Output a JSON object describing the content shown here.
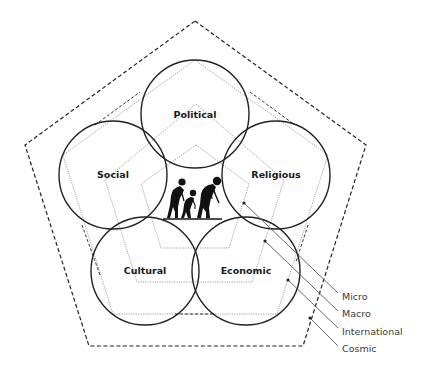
{
  "diagram": {
    "domains": [
      {
        "label": "Political",
        "cx": 195,
        "cy": 114,
        "r": 54
      },
      {
        "label": "Social",
        "cx": 113,
        "cy": 175,
        "r": 54
      },
      {
        "label": "Religious",
        "cx": 276,
        "cy": 175,
        "r": 54
      },
      {
        "label": "Cultural",
        "cx": 145,
        "cy": 271,
        "r": 54
      },
      {
        "label": "Economic",
        "cx": 246,
        "cy": 271,
        "r": 54
      }
    ],
    "center_icon": "human-evolution-figures-icon",
    "levels": [
      {
        "label": "Micro",
        "style": "dotted"
      },
      {
        "label": "Macro",
        "style": "dotted"
      },
      {
        "label": "International",
        "style": "dotted-dashed"
      },
      {
        "label": "Cosmic",
        "style": "dashed"
      }
    ],
    "colors": {
      "circle_stroke": "#222222",
      "pentagon_dotted": "#777777",
      "pentagon_dashed": "#222222",
      "leader_line": "#555555",
      "label_text": "#1a1a1a",
      "legend_text": "#3a3a3a"
    }
  }
}
